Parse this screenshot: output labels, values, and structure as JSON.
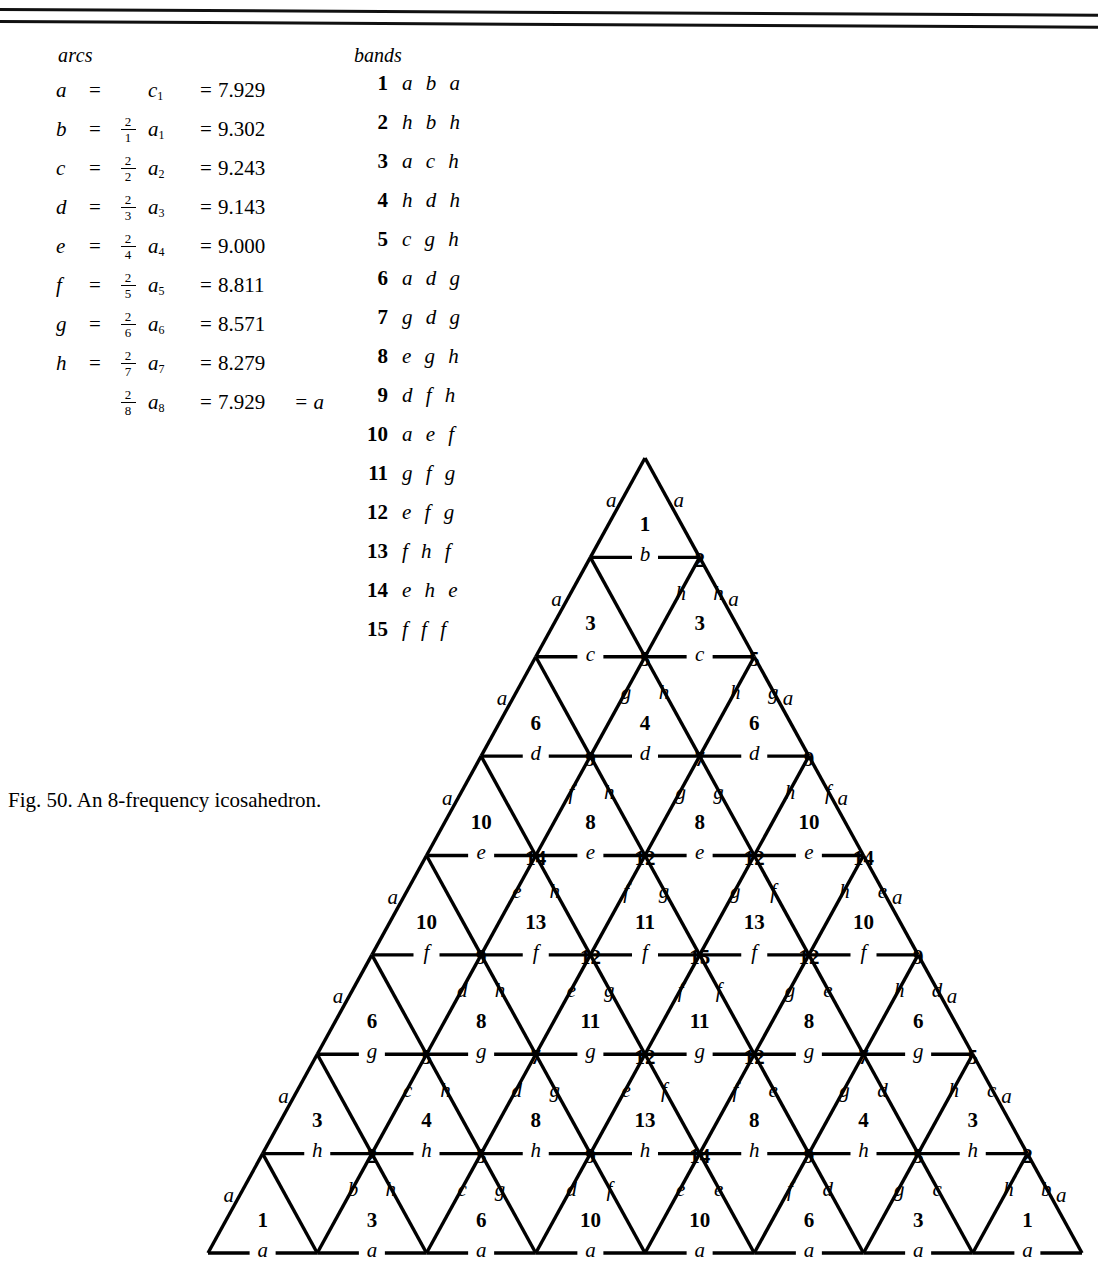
{
  "figure": {
    "caption": "Fig. 50.  An 8-frequency icosahedron.",
    "frequency": 8
  },
  "arcs": {
    "title": "arcs",
    "rows": [
      {
        "symbol": "a",
        "eq": "=",
        "num": "",
        "den": "",
        "term": "c",
        "sub": "1",
        "eq2": "=",
        "value": "7.929",
        "tail": ""
      },
      {
        "symbol": "b",
        "eq": "=",
        "num": "2",
        "den": "1",
        "term": "a",
        "sub": "1",
        "eq2": "=",
        "value": "9.302",
        "tail": ""
      },
      {
        "symbol": "c",
        "eq": "=",
        "num": "2",
        "den": "2",
        "term": "a",
        "sub": "2",
        "eq2": "=",
        "value": "9.243",
        "tail": ""
      },
      {
        "symbol": "d",
        "eq": "=",
        "num": "2",
        "den": "3",
        "term": "a",
        "sub": "3",
        "eq2": "=",
        "value": "9.143",
        "tail": ""
      },
      {
        "symbol": "e",
        "eq": "=",
        "num": "2",
        "den": "4",
        "term": "a",
        "sub": "4",
        "eq2": "=",
        "value": "9.000",
        "tail": ""
      },
      {
        "symbol": "f",
        "eq": "=",
        "num": "2",
        "den": "5",
        "term": "a",
        "sub": "5",
        "eq2": "=",
        "value": "8.811",
        "tail": ""
      },
      {
        "symbol": "g",
        "eq": "=",
        "num": "2",
        "den": "6",
        "term": "a",
        "sub": "6",
        "eq2": "=",
        "value": "8.571",
        "tail": ""
      },
      {
        "symbol": "h",
        "eq": "=",
        "num": "2",
        "den": "7",
        "term": "a",
        "sub": "7",
        "eq2": "=",
        "value": "8.279",
        "tail": ""
      },
      {
        "symbol": "",
        "eq": "",
        "num": "2",
        "den": "8",
        "term": "a",
        "sub": "8",
        "eq2": "=",
        "value": "7.929",
        "tail": "= a"
      }
    ]
  },
  "bands": {
    "title": "bands",
    "rows": [
      {
        "number": "1",
        "code": "a b a"
      },
      {
        "number": "2",
        "code": "h b h"
      },
      {
        "number": "3",
        "code": "a c h"
      },
      {
        "number": "4",
        "code": "h d h"
      },
      {
        "number": "5",
        "code": "c g h"
      },
      {
        "number": "6",
        "code": "a d g"
      },
      {
        "number": "7",
        "code": "g d g"
      },
      {
        "number": "8",
        "code": "e g h"
      },
      {
        "number": "9",
        "code": "d f h"
      },
      {
        "number": "10",
        "code": "a e f"
      },
      {
        "number": "11",
        "code": "g f g"
      },
      {
        "number": "12",
        "code": "e f g"
      },
      {
        "number": "13",
        "code": "f h f"
      },
      {
        "number": "14",
        "code": "e h e"
      },
      {
        "number": "15",
        "code": "f f f"
      }
    ]
  },
  "chart_data": {
    "type": "diagram",
    "geometry": {
      "apex": [
        645,
        458
      ],
      "bottom_left": [
        208,
        1253
      ],
      "bottom_right": [
        1082,
        1253
      ],
      "rows": 8
    },
    "horizontal_edge_letters": [
      "b",
      "c",
      "d",
      "e",
      "f",
      "g",
      "h",
      "a"
    ],
    "left_edge_letters": [
      "a",
      "a",
      "a",
      "a",
      "a",
      "a",
      "a",
      "a"
    ],
    "right_edge_letters": [
      "a",
      "a",
      "a",
      "a",
      "a",
      "a",
      "a",
      "a"
    ],
    "up_triangle_bands": [
      [
        "1"
      ],
      [
        "3",
        "3"
      ],
      [
        "6",
        "4",
        "6"
      ],
      [
        "10",
        "8",
        "8",
        "10"
      ],
      [
        "10",
        "13",
        "11",
        "13",
        "10"
      ],
      [
        "6",
        "8",
        "11",
        "11",
        "8",
        "6"
      ],
      [
        "3",
        "4",
        "8",
        "13",
        "8",
        "4",
        "3"
      ],
      [
        "1",
        "3",
        "6",
        "10",
        "10",
        "6",
        "3",
        "1"
      ]
    ],
    "down_triangle_bands": [
      [
        "2"
      ],
      [
        "5",
        "5"
      ],
      [
        "9",
        "7",
        "9"
      ],
      [
        "14",
        "12",
        "12",
        "14"
      ],
      [
        "9",
        "12",
        "15",
        "12",
        "9"
      ],
      [
        "5",
        "7",
        "12",
        "12",
        "7",
        "5"
      ],
      [
        "2",
        "5",
        "9",
        "14",
        "9",
        "5",
        "2"
      ]
    ],
    "interior_strut_letters_by_row": [
      [
        "h",
        "h"
      ],
      [
        "g",
        "h",
        "h",
        "g"
      ],
      [
        "f",
        "h",
        "g",
        "g",
        "h",
        "f"
      ],
      [
        "e",
        "h",
        "f",
        "g",
        "g",
        "f",
        "h",
        "e"
      ],
      [
        "d",
        "h",
        "e",
        "g",
        "f",
        "f",
        "g",
        "e",
        "h",
        "d"
      ],
      [
        "c",
        "h",
        "d",
        "g",
        "e",
        "f",
        "f",
        "e",
        "g",
        "d",
        "h",
        "c"
      ],
      [
        "b",
        "h",
        "c",
        "g",
        "d",
        "f",
        "e",
        "e",
        "f",
        "d",
        "g",
        "c",
        "h",
        "b"
      ]
    ]
  }
}
